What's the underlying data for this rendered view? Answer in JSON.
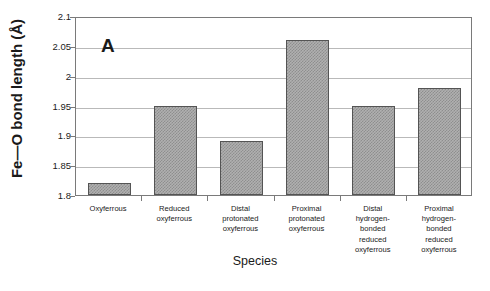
{
  "chart_data": {
    "type": "bar",
    "title": "",
    "panel_label": "A",
    "xlabel": "Species",
    "ylabel": "Fe—O bond length (Å)",
    "categories": [
      "Oxyferrous",
      "Reduced\noxyferrous",
      "Distal\nprotonated\noxyferrous",
      "Proximal\nprotonated\noxyferrous",
      "Distal\nhydrogen-\nbonded\nreduced\noxyferrous",
      "Proximal\nhydrogen-\nbonded\nreduced\noxyferrous"
    ],
    "values": [
      1.82,
      1.95,
      1.89,
      2.06,
      1.95,
      1.98
    ],
    "ylim": [
      1.8,
      2.1
    ],
    "yticks": [
      "1.8",
      "1.85",
      "1.9",
      "1.95",
      "2",
      "2.05",
      "2.1"
    ],
    "ytick_values": [
      1.8,
      1.85,
      1.9,
      1.95,
      2.0,
      2.05,
      2.1
    ],
    "grid": true,
    "grid_axis": "y",
    "legend": false,
    "bar_color": "#b0b0b0",
    "bar_edge_color": "#545454",
    "grid_color": "#b9b9b9",
    "axis_color": "#7a7a7a",
    "background": "#ffffff"
  }
}
